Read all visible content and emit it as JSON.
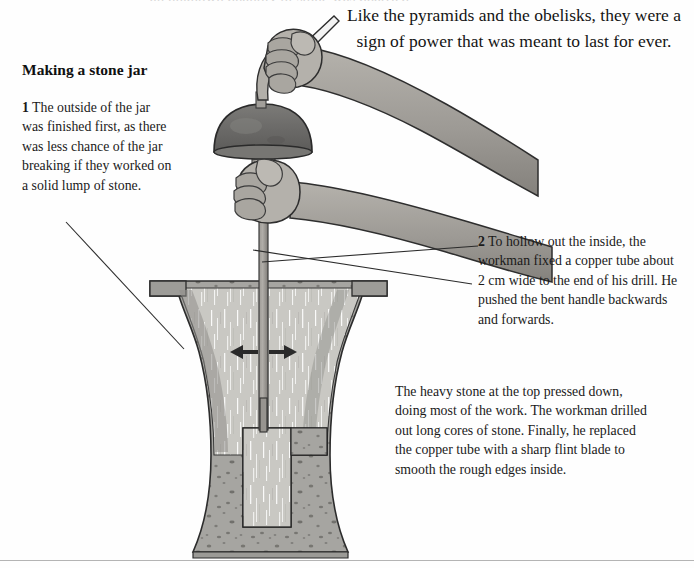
{
  "page": {
    "background_color": "#fefefe",
    "text_color": "#1a1a1a",
    "width": 694,
    "height": 568
  },
  "text": {
    "cutoff_top_line": "an unknown quantity of stone was quarried",
    "intro": "Like the pyramids and the obelisks, they were a sign of power that was meant to last for ever.",
    "heading": "Making a stone jar",
    "step1_number": "1",
    "step1_body": " The outside of the jar was finished first, as there was less chance of the jar breaking if they worked on a solid lump of stone.",
    "step2_number": "2",
    "step2_body": " To hollow out the inside, the workman fixed a copper tube about 2 cm wide to the end of his drill. He pushed the bent handle backwards and forwards.",
    "closing": "The heavy stone at the top pressed down, doing most of the work. The workman drilled out long cores of stone. Finally, he replaced the copper tube with a sharp flint blade to smooth the rough edges inside."
  },
  "illustration": {
    "title": "egyptian-stone-jar-drill-cutaway",
    "parts": [
      "bent-drill-handle",
      "upper-hand",
      "upper-forearm",
      "lower-hand",
      "lower-forearm",
      "stone-weight-dome",
      "binding-collar",
      "drill-shaft",
      "copper-tube-bit",
      "stone-jar-cutaway",
      "drilled-core-cavity",
      "left-arrow",
      "right-arrow",
      "leader-line-step1",
      "leader-line-step2",
      "ground-rule"
    ],
    "colors": {
      "skin_light": "#b7b4ae",
      "skin_mid": "#9a9793",
      "skin_shadow": "#7e7b77",
      "stone_weight_dark": "#6d6c6a",
      "stone_weight_light": "#8a8986",
      "jar_stone_body": "#a6a5a1",
      "jar_stone_inner": "#c9c8c3",
      "jar_stone_speckle": "#6e6d69",
      "jar_outline": "#2c2c2c",
      "shaft": "#8e8b86",
      "arrow": "#2a2a2a",
      "leader_line": "#2b2b2b",
      "ground_rule": "#b4b4b4"
    },
    "annotations": {
      "arrows_meaning": "bent handle pushed backwards and forwards",
      "arrow_left_direction": "left",
      "arrow_right_direction": "right"
    }
  }
}
